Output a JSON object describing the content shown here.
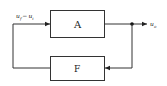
{
  "diagram": {
    "type": "feedback-block-diagram",
    "blocks": [
      {
        "id": "A",
        "label": "A"
      },
      {
        "id": "F",
        "label": "F"
      }
    ],
    "input_label_main": "u",
    "input_label_sub1": "f",
    "input_label_minus": "−",
    "input_label_main2": "u",
    "input_label_sub2": "i",
    "output_label_main": "u",
    "output_label_sub": "o",
    "colors": {
      "line": "#222222",
      "background": "#ffffff"
    }
  }
}
